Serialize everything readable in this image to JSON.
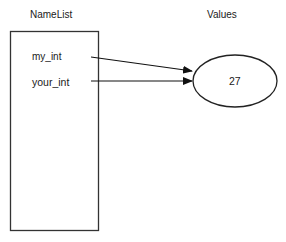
{
  "diagram": {
    "namelist": {
      "title": "NameList",
      "names": [
        {
          "label": "my_int"
        },
        {
          "label": "your_int"
        }
      ]
    },
    "values": {
      "title": "Values",
      "objects": [
        {
          "value": "27"
        }
      ]
    },
    "edges": [
      {
        "from": "my_int",
        "to": "27"
      },
      {
        "from": "your_int",
        "to": "27"
      }
    ]
  }
}
